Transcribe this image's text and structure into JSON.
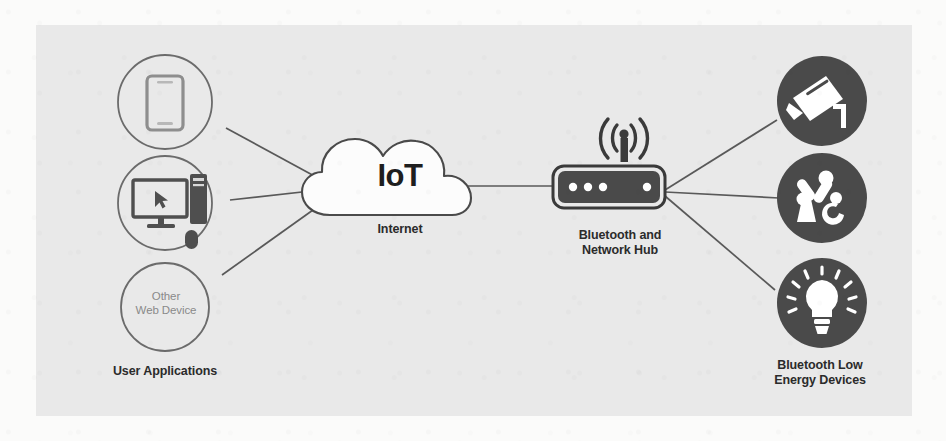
{
  "diagram": {
    "panel_color": "#e9e9e9",
    "page_color": "#fbfbfa",
    "stroke_color": "#595959",
    "icon_fill_color": "#4a4a4a",
    "icon_glyph_color": "#ffffff",
    "label_color": "#2b2b2b",
    "muted_label_color": "#8a8a8a"
  },
  "cloud": {
    "inner_label": "IoT",
    "caption": "Internet",
    "icon": "cloud-icon"
  },
  "hub": {
    "caption": "Bluetooth and\nNetwork Hub",
    "icon": "router-hub-icon",
    "antenna_icon": "wireless-signal-icon",
    "led_count_left": 3,
    "led_count_right": 1
  },
  "left_group": {
    "caption": "User Applications",
    "nodes": [
      {
        "id": "smartphone",
        "icon": "smartphone-icon",
        "label": ""
      },
      {
        "id": "desktop-computer",
        "icon": "desktop-computer-icon",
        "label": ""
      },
      {
        "id": "other-web-device",
        "icon": "",
        "label": "Other\nWeb Device"
      }
    ]
  },
  "right_group": {
    "caption": "Bluetooth Low\nEnergy Devices",
    "nodes": [
      {
        "id": "security-camera",
        "icon": "security-camera-icon"
      },
      {
        "id": "robotic-arm",
        "icon": "robotic-arm-icon"
      },
      {
        "id": "smart-light-bulb",
        "icon": "light-bulb-icon"
      }
    ]
  },
  "connections": [
    {
      "from": "smartphone",
      "to": "cloud"
    },
    {
      "from": "desktop-computer",
      "to": "cloud"
    },
    {
      "from": "other-web-device",
      "to": "cloud"
    },
    {
      "from": "cloud",
      "to": "hub"
    },
    {
      "from": "hub",
      "to": "security-camera"
    },
    {
      "from": "hub",
      "to": "robotic-arm"
    },
    {
      "from": "hub",
      "to": "smart-light-bulb"
    }
  ]
}
